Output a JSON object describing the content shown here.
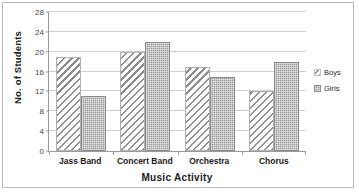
{
  "chart_data": {
    "type": "bar",
    "title": "",
    "xlabel": "Music Activity",
    "ylabel": "No. of Students",
    "categories": [
      "Jass Band",
      "Concert Band",
      "Orchestra",
      "Chorus"
    ],
    "series": [
      {
        "name": "Boys",
        "values": [
          19,
          20,
          17,
          12
        ],
        "pattern": "diagonal-hatch",
        "color": "#8d8d8d"
      },
      {
        "name": "Girls",
        "values": [
          11,
          22,
          15,
          18
        ],
        "pattern": "dotted-fill",
        "color": "#9a9a9a"
      }
    ],
    "ylim": [
      0,
      28
    ],
    "ytick_labels": [
      "0",
      "4",
      "8",
      "12",
      "16",
      "20",
      "24",
      "28"
    ],
    "ytick_values": [
      0,
      4,
      8,
      12,
      16,
      20,
      24,
      28
    ],
    "grid": true,
    "legend_position": "right",
    "legend": [
      "Boys",
      "Girls"
    ]
  },
  "axes": {
    "y_title": "No. of Students",
    "x_title": "Music Activity"
  }
}
